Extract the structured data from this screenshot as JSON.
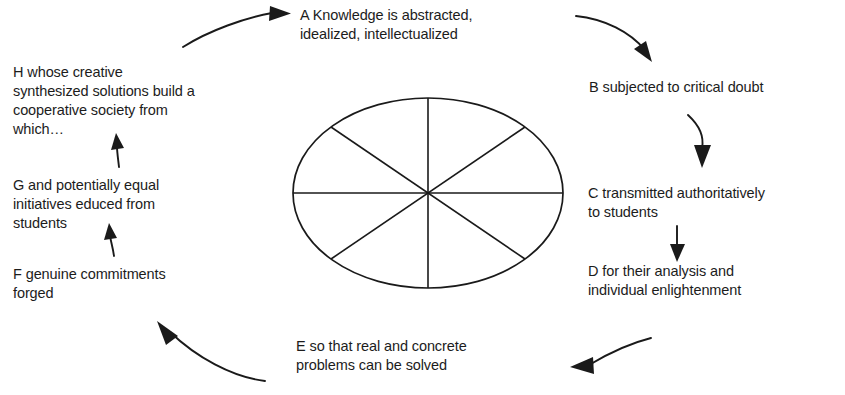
{
  "diagram": {
    "center_shape": {
      "name": "eight-spoke-wheel",
      "shape": "ellipse",
      "sectors": 8,
      "spokes": 4,
      "stroke_color": "#1a1a1a",
      "fill_color": "#ffffff"
    },
    "background_color": "#ffffff",
    "text_color": "#1c1c1c",
    "nodes": [
      {
        "id": "A",
        "label": "A Knowledge is abstracted,\nidealized, intellectualized"
      },
      {
        "id": "B",
        "label": "B subjected to critical doubt"
      },
      {
        "id": "C",
        "label": "C transmitted authoritatively\nto students"
      },
      {
        "id": "D",
        "label": "D for their analysis and\nindividual enlightenment"
      },
      {
        "id": "E",
        "label": "E so that real and concrete\nproblems can be solved"
      },
      {
        "id": "F",
        "label": "F genuine commitments\nforged"
      },
      {
        "id": "G",
        "label": "G and potentially equal\ninitiatives educed from\nstudents"
      },
      {
        "id": "H",
        "label": "H whose creative\nsynthesized solutions build a\ncooperative society from\nwhich…"
      }
    ],
    "arrows": [
      {
        "id": "arrow-h-to-a",
        "from": "H",
        "to": "A",
        "direction": "curve-up-right"
      },
      {
        "id": "arrow-a-to-b",
        "from": "A",
        "to": "B",
        "direction": "curve-down-right"
      },
      {
        "id": "arrow-b-to-c",
        "from": "B",
        "to": "C",
        "direction": "curve-down"
      },
      {
        "id": "arrow-c-to-d",
        "from": "C",
        "to": "D",
        "direction": "straight-down"
      },
      {
        "id": "arrow-d-to-e",
        "from": "D",
        "to": "E",
        "direction": "curve-down-left"
      },
      {
        "id": "arrow-e-to-f",
        "from": "E",
        "to": "F",
        "direction": "curve-up-left"
      },
      {
        "id": "arrow-f-to-g",
        "from": "F",
        "to": "G",
        "direction": "straight-up"
      },
      {
        "id": "arrow-g-to-h",
        "from": "G",
        "to": "H",
        "direction": "straight-up"
      }
    ]
  }
}
